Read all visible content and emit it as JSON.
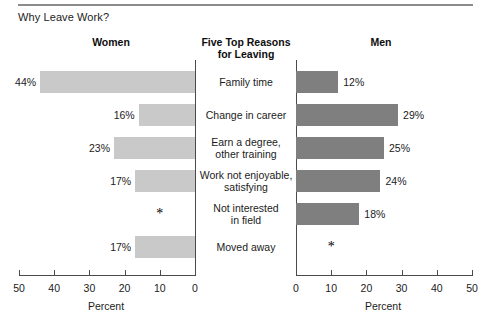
{
  "figure": {
    "title": "Why Leave Work?",
    "left_heading": "Women",
    "center_heading_line1": "Five Top Reasons",
    "center_heading_line2": "for Leaving",
    "right_heading": "Men",
    "axis_title": "Percent",
    "suppressed_marker": "*",
    "colors": {
      "women_bar": "#c9c9c9",
      "men_bar": "#7f7f7f",
      "axis": "#4a4a4a",
      "rule": "#8c8c8c",
      "text": "#1b1b1b"
    }
  },
  "chart_data": {
    "type": "bar",
    "orientation": "horizontal",
    "layout": "paired-pyramid",
    "title": "Why Leave Work?",
    "xlabel": "Percent",
    "ylabel": "",
    "grid": false,
    "legend": null,
    "categories": [
      "Family time",
      "Change in career",
      "Earn a degree, other training",
      "Work not enjoyable, satisfying",
      "Not interested in field",
      "Moved away"
    ],
    "category_lines": [
      [
        "Family time"
      ],
      [
        "Change in career"
      ],
      [
        "Earn a degree,",
        "other training"
      ],
      [
        "Work not enjoyable,",
        "satisfying"
      ],
      [
        "Not interested",
        "in field"
      ],
      [
        "Moved away"
      ]
    ],
    "series": [
      {
        "name": "Women",
        "direction": "left",
        "color": "#c9c9c9",
        "values": [
          44,
          16,
          23,
          17,
          null,
          17
        ],
        "labels": [
          "44%",
          "16%",
          "23%",
          "17%",
          "*",
          "17%"
        ]
      },
      {
        "name": "Men",
        "direction": "right",
        "color": "#7f7f7f",
        "values": [
          12,
          29,
          25,
          24,
          18,
          null
        ],
        "labels": [
          "12%",
          "29%",
          "25%",
          "24%",
          "18%",
          "*"
        ]
      }
    ],
    "xlim_left": [
      50,
      0
    ],
    "xlim_right": [
      0,
      50
    ],
    "xticks_left": [
      50,
      40,
      30,
      20,
      10,
      0
    ],
    "xticks_right": [
      0,
      10,
      20,
      30,
      40,
      50
    ],
    "xtick_labels_left": [
      "50",
      "40",
      "30",
      "20",
      "10",
      "0"
    ],
    "xtick_labels_right": [
      "0",
      "10",
      "20",
      "30",
      "40",
      "50"
    ]
  }
}
